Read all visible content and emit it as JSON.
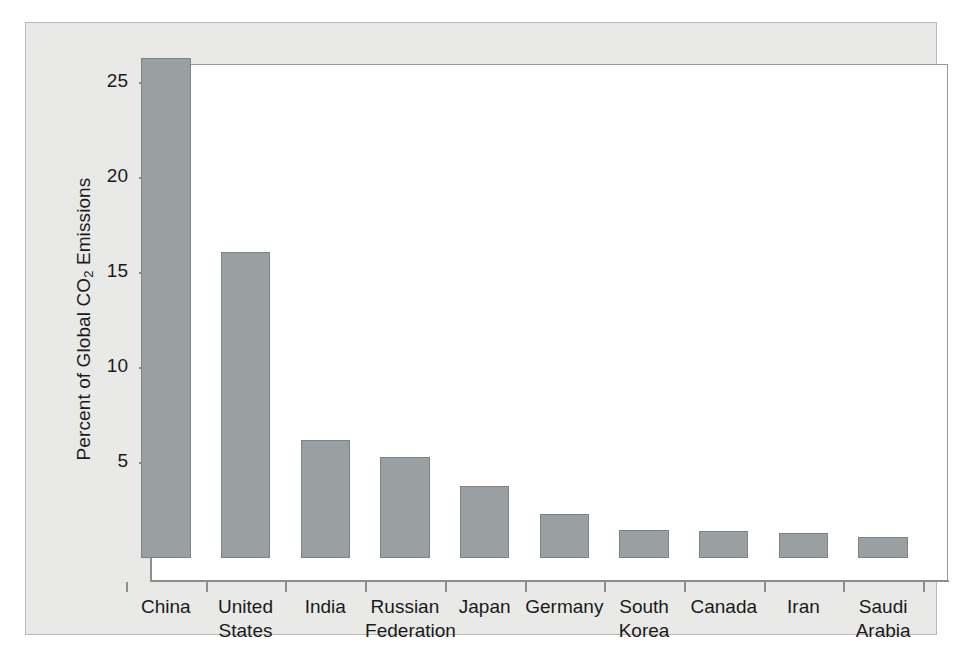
{
  "chart_data": {
    "type": "bar",
    "title": "",
    "subtitle": "",
    "xlabel": "",
    "ylabel": "Percent of Global CO2 Emissions",
    "ylabel_parts": {
      "before": "Percent of Global CO",
      "sub": "2",
      "after": " Emissions"
    },
    "categories": [
      "China",
      "United States",
      "India",
      "Russian Federation",
      "Japan",
      "Germany",
      "South Korea",
      "Canada",
      "Iran",
      "Saudi Arabia"
    ],
    "category_lines": [
      [
        "China",
        ""
      ],
      [
        "United",
        "States"
      ],
      [
        "India",
        ""
      ],
      [
        "Russian",
        "Federation"
      ],
      [
        "Japan",
        ""
      ],
      [
        "Germany",
        ""
      ],
      [
        "South",
        "Korea"
      ],
      [
        "Canada",
        ""
      ],
      [
        "Iran",
        ""
      ],
      [
        "Saudi",
        "Arabia"
      ]
    ],
    "values": [
      26.3,
      16.1,
      6.2,
      5.3,
      3.8,
      2.3,
      1.5,
      1.4,
      1.3,
      1.1
    ],
    "ylim": [
      0,
      27.5
    ],
    "yticks": [
      5,
      10,
      15,
      20,
      25
    ],
    "ytick_labels": [
      "5",
      "10",
      "15",
      "20",
      "25"
    ],
    "grid": false,
    "legend": false,
    "legend_position": "none",
    "bar_color": "#9a9fa1",
    "bar_edge_color": "#7d8284",
    "plot_background": "#ffffff",
    "figure_background": "#e9e9e7",
    "axis_color": "#8d8d8b"
  }
}
